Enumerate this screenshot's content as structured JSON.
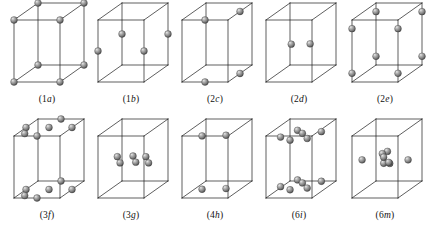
{
  "figure": {
    "background_color": "#ffffff",
    "line_color": "#1a1a1a",
    "atom_color": "#8a8a8a",
    "rows": 2,
    "columns": 5,
    "atom_radius_px": 3.4
  },
  "cells": [
    {
      "id": "cell-1a",
      "caption_prefix": "(1",
      "caption_letter": "a",
      "caption_suffix": ")",
      "caption": "(1a)",
      "multiplicity": 1,
      "wyckoff_letter": "a",
      "atom_count": 8,
      "atom_description": "atoms at the eight cell corners",
      "atoms": [
        {
          "u": 0.0,
          "v": 0.0,
          "w": 0.0
        },
        {
          "u": 1.0,
          "v": 0.0,
          "w": 0.0
        },
        {
          "u": 0.0,
          "v": 1.0,
          "w": 0.0
        },
        {
          "u": 1.0,
          "v": 1.0,
          "w": 0.0
        },
        {
          "u": 0.0,
          "v": 0.0,
          "w": 1.0
        },
        {
          "u": 1.0,
          "v": 0.0,
          "w": 1.0
        },
        {
          "u": 0.0,
          "v": 1.0,
          "w": 1.0
        },
        {
          "u": 1.0,
          "v": 1.0,
          "w": 1.0
        }
      ]
    },
    {
      "id": "cell-1b",
      "caption_prefix": "(1",
      "caption_letter": "b",
      "caption_suffix": ")",
      "caption": "(1b)",
      "multiplicity": 1,
      "wyckoff_letter": "b",
      "atom_count": 4,
      "atom_description": "atoms at mid-height of the four vertical edges",
      "atoms": [
        {
          "u": 0.0,
          "v": 0.0,
          "w": 0.5
        },
        {
          "u": 1.0,
          "v": 0.0,
          "w": 0.5
        },
        {
          "u": 0.0,
          "v": 1.0,
          "w": 0.5
        },
        {
          "u": 1.0,
          "v": 1.0,
          "w": 0.5
        }
      ]
    },
    {
      "id": "cell-2c",
      "caption_prefix": "(2",
      "caption_letter": "c",
      "caption_suffix": ")",
      "caption": "(2c)",
      "multiplicity": 2,
      "wyckoff_letter": "c",
      "atom_count": 4,
      "atom_description": "two atoms on the top face and two on the bottom face at edge midpoints",
      "atoms": [
        {
          "u": 0.5,
          "v": 0.0,
          "w": 1.0
        },
        {
          "u": 1.0,
          "v": 0.5,
          "w": 1.0
        },
        {
          "u": 0.5,
          "v": 0.0,
          "w": 0.0
        },
        {
          "u": 1.0,
          "v": 0.5,
          "w": 0.0
        }
      ]
    },
    {
      "id": "cell-2d",
      "caption_prefix": "(2",
      "caption_letter": "d",
      "caption_suffix": ")",
      "caption": "(2d)",
      "multiplicity": 2,
      "wyckoff_letter": "d",
      "atom_count": 2,
      "atom_description": "two interior atoms at mid-height",
      "atoms": [
        {
          "u": 0.34,
          "v": 0.4,
          "w": 0.5
        },
        {
          "u": 0.74,
          "v": 0.42,
          "w": 0.5
        }
      ]
    },
    {
      "id": "cell-2e",
      "caption_prefix": "(2",
      "caption_letter": "e",
      "caption_suffix": ")",
      "caption": "(2e)",
      "multiplicity": 2,
      "wyckoff_letter": "e",
      "atom_count": 8,
      "atom_description": "atoms on the four vertical edges near the top and near the bottom",
      "atoms": [
        {
          "u": 0.0,
          "v": 0.0,
          "w": 0.86
        },
        {
          "u": 1.0,
          "v": 0.0,
          "w": 0.86
        },
        {
          "u": 0.0,
          "v": 1.0,
          "w": 0.86
        },
        {
          "u": 1.0,
          "v": 1.0,
          "w": 0.86
        },
        {
          "u": 0.0,
          "v": 0.0,
          "w": 0.14
        },
        {
          "u": 1.0,
          "v": 0.0,
          "w": 0.14
        },
        {
          "u": 0.0,
          "v": 1.0,
          "w": 0.14
        },
        {
          "u": 1.0,
          "v": 1.0,
          "w": 0.14
        }
      ]
    },
    {
      "id": "cell-3f",
      "caption_prefix": "(3",
      "caption_letter": "f",
      "caption_suffix": ")",
      "caption": "(3f)",
      "multiplicity": 3,
      "wyckoff_letter": "f",
      "atom_count": 12,
      "atom_description": "six atoms on the top face and six on the bottom face",
      "atoms": [
        {
          "u": 0.0,
          "v": 0.5,
          "w": 1.0
        },
        {
          "u": 0.5,
          "v": 0.0,
          "w": 1.0
        },
        {
          "u": 0.5,
          "v": 1.0,
          "w": 1.0
        },
        {
          "u": 1.0,
          "v": 0.5,
          "w": 1.0
        },
        {
          "u": 0.5,
          "v": 0.5,
          "w": 1.0
        },
        {
          "u": 0.16,
          "v": 0.14,
          "w": 1.0
        },
        {
          "u": 0.0,
          "v": 0.5,
          "w": 0.0
        },
        {
          "u": 0.5,
          "v": 0.0,
          "w": 0.0
        },
        {
          "u": 0.5,
          "v": 1.0,
          "w": 0.0
        },
        {
          "u": 1.0,
          "v": 0.5,
          "w": 0.0
        },
        {
          "u": 0.5,
          "v": 0.5,
          "w": 0.0
        },
        {
          "u": 0.16,
          "v": 0.14,
          "w": 0.0
        }
      ]
    },
    {
      "id": "cell-3g",
      "caption_prefix": "(3",
      "caption_letter": "g",
      "caption_suffix": ")",
      "caption": "(3g)",
      "multiplicity": 3,
      "wyckoff_letter": "g",
      "atom_count": 6,
      "atom_description": "three pairs of interior atoms at mid-height",
      "atoms": [
        {
          "u": 0.18,
          "v": 0.46,
          "w": 0.54
        },
        {
          "u": 0.24,
          "v": 0.46,
          "w": 0.44
        },
        {
          "u": 0.5,
          "v": 0.5,
          "w": 0.54
        },
        {
          "u": 0.56,
          "v": 0.5,
          "w": 0.44
        },
        {
          "u": 0.8,
          "v": 0.46,
          "w": 0.54
        },
        {
          "u": 0.86,
          "v": 0.46,
          "w": 0.44
        }
      ]
    },
    {
      "id": "cell-4h",
      "caption_prefix": "(4",
      "caption_letter": "h",
      "caption_suffix": ")",
      "caption": "(4h)",
      "multiplicity": 4,
      "wyckoff_letter": "h",
      "atom_count": 4,
      "atom_description": "two atoms near the top face and two near the bottom face, inset from the edges",
      "atoms": [
        {
          "u": 0.3,
          "v": 0.26,
          "w": 0.93
        },
        {
          "u": 0.8,
          "v": 0.3,
          "w": 0.93
        },
        {
          "u": 0.3,
          "v": 0.26,
          "w": 0.07
        },
        {
          "u": 0.8,
          "v": 0.3,
          "w": 0.07
        }
      ]
    },
    {
      "id": "cell-6i",
      "caption_prefix": "(6",
      "caption_letter": "i",
      "caption_suffix": ")",
      "caption": "(6i)",
      "multiplicity": 6,
      "wyckoff_letter": "i",
      "atom_count": 12,
      "atom_description": "six atoms in the upper part of the cell and six in the lower part",
      "atoms": [
        {
          "u": 0.16,
          "v": 0.3,
          "w": 0.9
        },
        {
          "u": 0.46,
          "v": 0.12,
          "w": 0.9
        },
        {
          "u": 0.52,
          "v": 0.52,
          "w": 0.9
        },
        {
          "u": 0.78,
          "v": 0.22,
          "w": 0.9
        },
        {
          "u": 0.88,
          "v": 0.62,
          "w": 0.9
        },
        {
          "u": 0.32,
          "v": 0.7,
          "w": 0.9
        },
        {
          "u": 0.16,
          "v": 0.3,
          "w": 0.1
        },
        {
          "u": 0.46,
          "v": 0.12,
          "w": 0.1
        },
        {
          "u": 0.52,
          "v": 0.52,
          "w": 0.1
        },
        {
          "u": 0.78,
          "v": 0.22,
          "w": 0.1
        },
        {
          "u": 0.88,
          "v": 0.62,
          "w": 0.1
        },
        {
          "u": 0.32,
          "v": 0.7,
          "w": 0.1
        }
      ]
    },
    {
      "id": "cell-6m",
      "caption_prefix": "(6",
      "caption_letter": "m",
      "caption_suffix": ")",
      "caption": "(6m)",
      "multiplicity": 6,
      "wyckoff_letter": "m",
      "atom_count": 8,
      "atom_description": "a central cluster of atoms with two further atoms at the left and right mid-height edges",
      "atoms": [
        {
          "u": 0.0,
          "v": 0.42,
          "w": 0.5
        },
        {
          "u": 1.0,
          "v": 0.42,
          "w": 0.5
        },
        {
          "u": 0.44,
          "v": 0.42,
          "w": 0.6
        },
        {
          "u": 0.52,
          "v": 0.48,
          "w": 0.62
        },
        {
          "u": 0.5,
          "v": 0.36,
          "w": 0.56
        },
        {
          "u": 0.46,
          "v": 0.44,
          "w": 0.44
        },
        {
          "u": 0.56,
          "v": 0.5,
          "w": 0.42
        },
        {
          "u": 0.6,
          "v": 0.38,
          "w": 0.47
        }
      ]
    }
  ]
}
